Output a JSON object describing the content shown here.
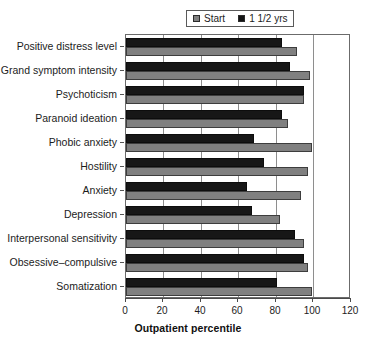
{
  "legend": {
    "position": "top-center",
    "entries": [
      {
        "label": "Start",
        "swatch": "start",
        "color": "#808080"
      },
      {
        "label": "1 1/2 yrs",
        "swatch": "followup",
        "color": "#171717"
      }
    ]
  },
  "axis": {
    "x_title": "Outpatient percentile",
    "x_ticks": [
      "0",
      "20",
      "40",
      "60",
      "80",
      "100",
      "120"
    ]
  },
  "chart_data": {
    "type": "bar",
    "orientation": "horizontal",
    "title": "",
    "subtitle": "",
    "xlabel": "Outpatient percentile",
    "ylabel": "",
    "xlim": [
      0,
      120
    ],
    "xticks": [
      0,
      20,
      40,
      60,
      80,
      100,
      120
    ],
    "grid": true,
    "grid_axis": "x",
    "legend": [
      "Start",
      "1 1/2 yrs"
    ],
    "legend_position": "top-center",
    "categories": [
      "Positive distress level",
      "Grand symptom intensity",
      "Psychoticism",
      "Paranoid ideation",
      "Phobic anxiety",
      "Hostility",
      "Anxiety",
      "Depression",
      "Interpersonal sensitivity",
      "Obsessive–compulsive",
      "Somatization"
    ],
    "series": [
      {
        "name": "Start",
        "color": "#808080",
        "values": [
          92,
          99,
          96,
          87,
          100,
          98,
          94,
          83,
          96,
          98,
          100
        ]
      },
      {
        "name": "1 1/2 yrs",
        "color": "#171717",
        "values": [
          84,
          88,
          96,
          84,
          69,
          74,
          65,
          68,
          91,
          96,
          81
        ]
      }
    ]
  }
}
